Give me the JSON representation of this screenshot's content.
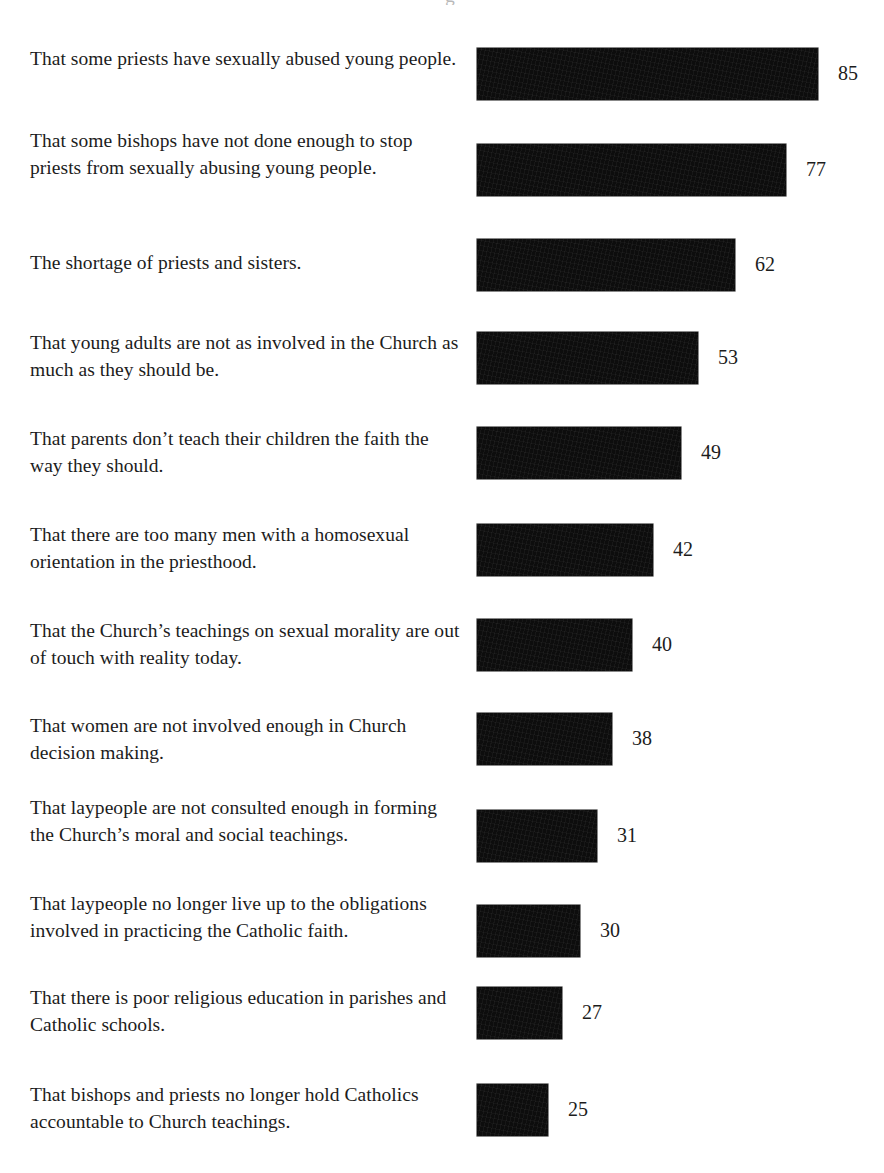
{
  "header_remnant": "g",
  "corner_remnant": "",
  "chart_data": {
    "type": "bar",
    "orientation": "horizontal",
    "title": "",
    "subtitle": "",
    "xlabel": "",
    "ylabel": "",
    "xlim": [
      0,
      100
    ],
    "grid": false,
    "legend": false,
    "value_suffix": "",
    "bar_color": "#0d0d0d",
    "categories": [
      "That some priests have sexually abused young people.",
      "That some bishops have not done enough to stop priests from sexually abusing young people.",
      "The shortage of priests and sisters.",
      "That young adults are not as involved in the Church as much as they should be.",
      "That parents don’t teach their children the faith the way they should.",
      "That there are too many men with a homosexual orientation in the priesthood.",
      "That the Church’s teachings on sexual morality are out of touch with reality today.",
      "That women are not involved enough in Church decision making.",
      "That laypeople are not consulted enough in forming the Church’s moral and social teachings.",
      "That laypeople no longer live up to the obligations involved in practicing the Catholic faith.",
      "That there is poor religious education in parishes and Catholic schools.",
      "That bishops and priests no longer hold Catholics accountable to Church teachings."
    ],
    "values": [
      85,
      77,
      62,
      53,
      49,
      42,
      40,
      38,
      31,
      30,
      27,
      25
    ],
    "value_labels": [
      "85",
      "77",
      "62",
      "53",
      "49",
      "42",
      "40",
      "38",
      "31",
      "30",
      "27",
      "25"
    ]
  },
  "rows": [
    {
      "label": "That some priests have sexually abused young people.",
      "value": 85,
      "value_label": "85",
      "top": 48,
      "label_top": 46,
      "bar_width": 341
    },
    {
      "label": "That some bishops have not done enough to stop priests from sexually abusing young people.",
      "value": 77,
      "value_label": "77",
      "top": 144,
      "label_top": 128,
      "bar_width": 309
    },
    {
      "label": "The shortage of priests and sisters.",
      "value": 62,
      "value_label": "62",
      "top": 239,
      "label_top": 250,
      "bar_width": 258
    },
    {
      "label": "That young adults are not as involved in the Church as much as they should be.",
      "value": 53,
      "value_label": "53",
      "top": 332,
      "label_top": 330,
      "bar_width": 221
    },
    {
      "label": "That parents don’t teach their children the faith the way they should.",
      "value": 49,
      "value_label": "49",
      "top": 427,
      "label_top": 426,
      "bar_width": 204
    },
    {
      "label": "That there are too many men with a homosexual orientation in the priesthood.",
      "value": 42,
      "value_label": "42",
      "top": 524,
      "label_top": 522,
      "bar_width": 176
    },
    {
      "label": "That the Church’s teachings on sexual morality are out of touch with reality today.",
      "value": 40,
      "value_label": "40",
      "top": 619,
      "label_top": 618,
      "bar_width": 155
    },
    {
      "label": "That women are not involved enough in Church decision making.",
      "value": 38,
      "value_label": "38",
      "top": 713,
      "label_top": 713,
      "bar_width": 135
    },
    {
      "label": "That laypeople are not consulted enough in forming the Church’s moral and social teachings.",
      "value": 31,
      "value_label": "31",
      "top": 810,
      "label_top": 795,
      "bar_width": 120
    },
    {
      "label": "That laypeople no longer live up to the obligations involved in practicing the Catholic faith.",
      "value": 30,
      "value_label": "30",
      "top": 905,
      "label_top": 891,
      "bar_width": 103
    },
    {
      "label": "That there is poor religious education in parishes and Catholic schools.",
      "value": 27,
      "value_label": "27",
      "top": 987,
      "label_top": 985,
      "bar_width": 85
    },
    {
      "label": "That bishops and priests no longer hold Catholics accountable to Church teachings.",
      "value": 25,
      "value_label": "25",
      "top": 1084,
      "label_top": 1082,
      "bar_width": 71
    }
  ]
}
